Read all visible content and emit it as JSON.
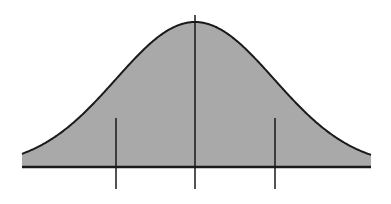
{
  "diagram": {
    "type": "normal-distribution-curve",
    "colors": {
      "background": "#ffffff",
      "fill": "#a9a9a9",
      "stroke": "#1a1a1a"
    },
    "curve": {
      "mean_x": 195,
      "sigma_px": 79,
      "baseline_y": 167,
      "peak_y": 22,
      "x_start": 22,
      "x_end": 371
    },
    "markers": [
      {
        "name": "minus-one-sigma",
        "x": 116,
        "y_top": 118,
        "y_bottom": 189
      },
      {
        "name": "mean",
        "x": 195,
        "y_top": 15,
        "y_bottom": 189
      },
      {
        "name": "plus-one-sigma",
        "x": 275,
        "y_top": 118,
        "y_bottom": 189
      }
    ]
  }
}
